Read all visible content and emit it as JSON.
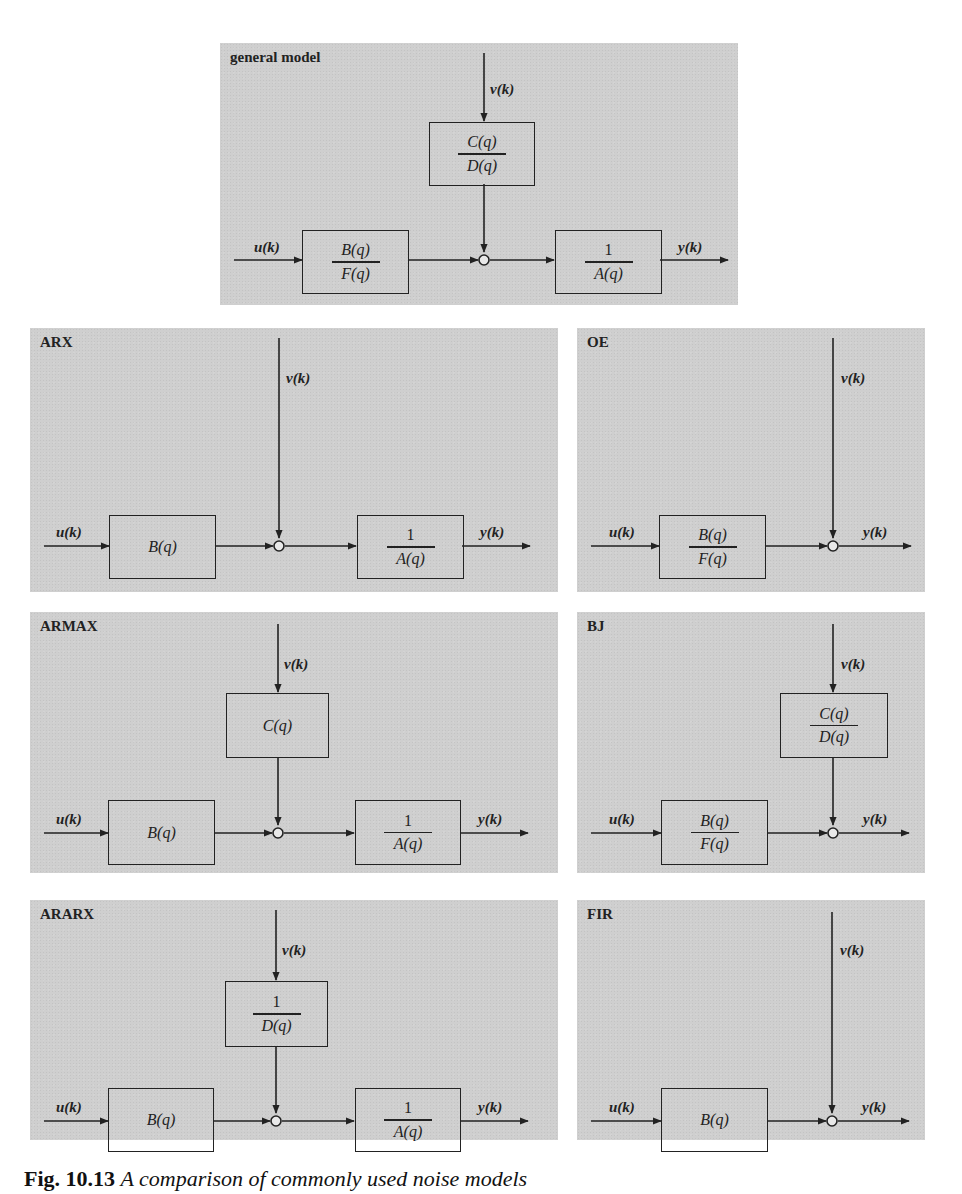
{
  "figure": {
    "caption_label": "Fig. 10.13",
    "caption_text": "A comparison of commonly used noise models"
  },
  "signals": {
    "input": "u(k)",
    "noise": "v(k)",
    "output": "y(k)"
  },
  "panels": {
    "general": {
      "title": "general model",
      "noise_block": {
        "num": "C(q)",
        "den": "D(q)"
      },
      "input_block": {
        "num": "B(q)",
        "den": "F(q)"
      },
      "output_block": {
        "num": "1",
        "den": "A(q)"
      }
    },
    "arx": {
      "title": "ARX",
      "input_block": {
        "num": "B(q)"
      },
      "output_block": {
        "num": "1",
        "den": "A(q)"
      }
    },
    "oe": {
      "title": "OE",
      "input_block": {
        "num": "B(q)",
        "den": "F(q)"
      }
    },
    "armax": {
      "title": "ARMAX",
      "noise_block": {
        "num": "C(q)"
      },
      "input_block": {
        "num": "B(q)"
      },
      "output_block": {
        "num": "1",
        "den": "A(q)"
      }
    },
    "bj": {
      "title": "BJ",
      "noise_block": {
        "num": "C(q)",
        "den": "D(q)"
      },
      "input_block": {
        "num": "B(q)",
        "den": "F(q)"
      }
    },
    "ararx": {
      "title": "ARARX",
      "noise_block": {
        "num": "1",
        "den": "D(q)"
      },
      "input_block": {
        "num": "B(q)"
      },
      "output_block": {
        "num": "1",
        "den": "A(q)"
      }
    },
    "fir": {
      "title": "FIR",
      "input_block": {
        "num": "B(q)"
      }
    }
  },
  "colors": {
    "panel_background": "#cfcfcf",
    "line": "#222222",
    "page_background": "#ffffff"
  }
}
